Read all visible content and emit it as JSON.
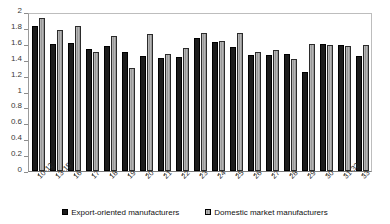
{
  "chart_data": {
    "type": "bar",
    "title": "",
    "xlabel": "",
    "ylabel": "",
    "ylim": [
      0,
      2
    ],
    "grid": false,
    "legend_position": "bottom",
    "yticks": [
      "0",
      "0.2",
      "0.4",
      "0.6",
      "0.8",
      "1",
      "1.2",
      "1.4",
      "1.6",
      "1.8",
      "2"
    ],
    "categories": [
      "10-12",
      "13-15",
      "16",
      "17",
      "18",
      "19",
      "20",
      "21",
      "22",
      "23",
      "24",
      "25",
      "26",
      "27",
      "28",
      "29",
      "30",
      "31-32",
      "33"
    ],
    "series": [
      {
        "name": "Export-oriented manufacturers",
        "color": "#1c1c1c",
        "values": [
          1.83,
          1.6,
          1.61,
          1.53,
          1.57,
          1.5,
          1.45,
          1.42,
          1.43,
          1.67,
          1.62,
          1.56,
          1.46,
          1.46,
          1.47,
          1.24,
          1.6,
          1.58,
          1.45
        ]
      },
      {
        "name": "Domestic market manufacturers",
        "color": "#a6a6a6",
        "values": [
          1.92,
          1.77,
          1.83,
          1.5,
          1.7,
          1.3,
          1.72,
          1.47,
          1.55,
          1.73,
          1.64,
          1.74,
          1.5,
          1.52,
          1.41,
          1.6,
          1.59,
          1.57,
          1.58
        ]
      }
    ]
  },
  "legend": {
    "items": [
      {
        "label": "Export-oriented manufacturers"
      },
      {
        "label": "Domestic market manufacturers"
      }
    ]
  }
}
